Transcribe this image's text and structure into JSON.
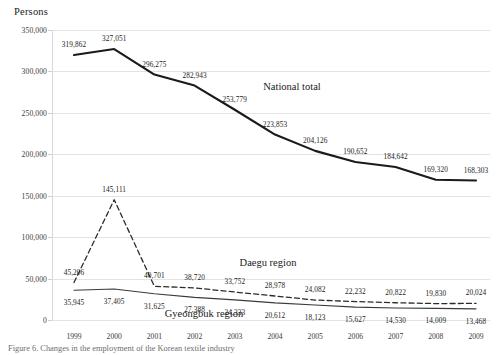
{
  "axis_title": "Persons",
  "caption": "Figure 6. Changes in the employment of the Korean textile industry",
  "chart_data": {
    "type": "line",
    "title": "",
    "xlabel": "",
    "ylabel": "Persons",
    "ylim": [
      0,
      350000
    ],
    "ytick_labels": [
      "0",
      "50,000",
      "100,000",
      "150,000",
      "200,000",
      "250,000",
      "300,000",
      "350,000"
    ],
    "ytick_values": [
      0,
      50000,
      100000,
      150000,
      200000,
      250000,
      300000,
      350000
    ],
    "grid": true,
    "legend": "inline-annotations",
    "categories": [
      "1999",
      "2000",
      "2001",
      "2002",
      "2003",
      "2004",
      "2005",
      "2006",
      "2007",
      "2008",
      "2009"
    ],
    "series": [
      {
        "name": "National total",
        "style": "solid-thick",
        "color": "#1a1a1a",
        "label_position": "above",
        "values": [
          319862,
          327051,
          296275,
          282943,
          253779,
          223853,
          204126,
          190652,
          184642,
          169320,
          168303
        ],
        "labels": [
          "319,862",
          "327,051",
          "296,275",
          "282,943",
          "253,779",
          "223,853",
          "204,126",
          "190,652",
          "184,642",
          "169,320",
          "168,303"
        ]
      },
      {
        "name": "Daegu region",
        "style": "dashed",
        "color": "#2b2b2b",
        "label_position": "above",
        "values": [
          45206,
          145111,
          40701,
          38720,
          33752,
          28978,
          24082,
          22232,
          20822,
          19830,
          20024
        ],
        "labels": [
          "45,206",
          "145,111",
          "40,701",
          "38,720",
          "33,752",
          "28,978",
          "24,082",
          "22,232",
          "20,822",
          "19,830",
          "20,024"
        ]
      },
      {
        "name": "Gyeongbuk region",
        "style": "solid-thin",
        "color": "#3a3a3a",
        "label_position": "below",
        "values": [
          35945,
          37405,
          31625,
          27388,
          24333,
          20612,
          18123,
          15627,
          14530,
          14009,
          13468
        ],
        "labels": [
          "35,945",
          "37,405",
          "31,625",
          "27,388",
          "24,333",
          "20,612",
          "18,123",
          "15,627",
          "14,530",
          "14,009",
          "13,468"
        ]
      }
    ],
    "series_annotations": [
      {
        "name": "National total",
        "text": "National total"
      },
      {
        "name": "Daegu region",
        "text": "Daegu region"
      },
      {
        "name": "Gyeongbuk region",
        "text": "Gyeongbuk region"
      }
    ]
  }
}
